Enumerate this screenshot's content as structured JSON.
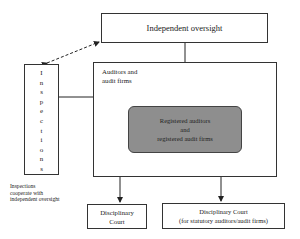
{
  "diagram": {
    "independent_oversight": "Independent oversight",
    "inspections_letters": [
      "I",
      "n",
      "s",
      "p",
      "e",
      "c",
      "t",
      "i",
      "o",
      "n",
      "s"
    ],
    "inspections": "Inspections",
    "auditors_label_line1": "Auditors and",
    "auditors_label_line2": "audit firms",
    "registered_line1": "Registered auditors",
    "registered_line2": "and",
    "registered_line3": "registered audit firms",
    "court_left_line1": "Disciplinary",
    "court_left_line2": "Court",
    "court_right_line1": "Disciplinary Court",
    "court_right_line2": "(for statutory auditors/audit firms)",
    "note_line1": "Inspections",
    "note_line2": "cooperate with",
    "note_line3": "independent oversight",
    "colors": {
      "registered_fill": "#8e8e8e",
      "border": "#333333",
      "background": "#ffffff"
    }
  }
}
